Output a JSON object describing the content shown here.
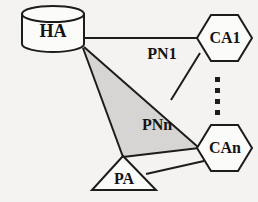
{
  "diagram": {
    "background_color": "#f4f3f1",
    "stroke_color": "#1c1c1c",
    "shaded_region_color": "#d6d5d3",
    "nodes": [
      {
        "id": "ha",
        "label": "HA",
        "shape": "cylinder",
        "x": 53,
        "y": 32
      },
      {
        "id": "ca1",
        "label": "CA1",
        "shape": "hexagon",
        "x": 224,
        "y": 38
      },
      {
        "id": "can",
        "label": "CAn",
        "shape": "hexagon",
        "x": 224,
        "y": 148
      },
      {
        "id": "pa",
        "label": "PA",
        "shape": "triangle",
        "x": 124,
        "y": 178
      }
    ],
    "edge_labels": [
      {
        "id": "pn1",
        "label": "PN1",
        "x": 162,
        "y": 55
      },
      {
        "id": "pnn",
        "label": "PNn",
        "x": 157,
        "y": 126
      }
    ],
    "ellipsis": {
      "name": "vertical-ellipsis",
      "dot_count": 4,
      "x": 218,
      "y_start": 79,
      "y_step": 11
    }
  }
}
